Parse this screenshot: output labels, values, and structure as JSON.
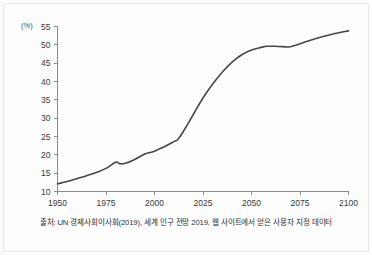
{
  "figure": {
    "unit_label": "(%)",
    "source_caption": "출처: UN 경제사회이사회(2019), 세계 인구 전망 2019, 웹 사이트에서 얻은 사용자 지정 데이터",
    "line_color": "#474747",
    "axis_color": "#8c8c8c",
    "text_color": "#3a3a3a",
    "background_color": "#fdfdfd"
  },
  "chart_data": {
    "type": "line",
    "title": "",
    "subtitle": "",
    "xlabel": "",
    "ylabel": "(%)",
    "xlim": [
      1950,
      2100
    ],
    "ylim": [
      10,
      55
    ],
    "xticks": [
      1950,
      1975,
      2000,
      2025,
      2050,
      2075,
      2100
    ],
    "xticklabels": [
      "1950",
      "1975",
      "2000",
      "2025",
      "2050",
      "2075",
      "2100"
    ],
    "yticks": [
      10,
      15,
      20,
      25,
      30,
      35,
      40,
      45,
      50,
      55
    ],
    "yticklabels": [
      "10",
      "15",
      "20",
      "25",
      "30",
      "35",
      "40",
      "45",
      "50",
      "55"
    ],
    "grid": false,
    "legend": null,
    "legend_position": "none",
    "annotations": [],
    "series": [
      {
        "name": "비율",
        "x": [
          1950,
          1955,
          1960,
          1965,
          1970,
          1975,
          1980,
          1982,
          1985,
          1990,
          1995,
          2000,
          2005,
          2010,
          2012,
          2015,
          2020,
          2025,
          2030,
          2035,
          2040,
          2045,
          2050,
          2055,
          2058,
          2062,
          2066,
          2070,
          2075,
          2080,
          2085,
          2090,
          2095,
          2100
        ],
        "y": [
          12.1,
          12.7,
          13.5,
          14.3,
          15.2,
          16.3,
          18.0,
          17.6,
          17.7,
          18.8,
          20.2,
          21.0,
          22.2,
          23.6,
          24.2,
          26.5,
          31.0,
          35.5,
          39.3,
          42.6,
          45.3,
          47.3,
          48.6,
          49.3,
          49.6,
          49.6,
          49.5,
          49.5,
          50.3,
          51.2,
          52.0,
          52.7,
          53.3,
          53.8
        ]
      }
    ]
  }
}
